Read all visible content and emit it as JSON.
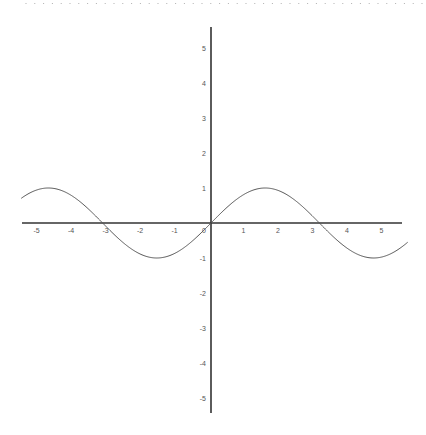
{
  "chart_data": {
    "type": "line",
    "title": "",
    "xlabel": "",
    "ylabel": "",
    "function": "y = sin(x)",
    "xlim": [
      -5.5,
      5.7
    ],
    "ylim": [
      -5.5,
      5.5
    ],
    "grid": false,
    "legend": null,
    "x_ticks": [
      -5,
      -4,
      -3,
      -2,
      -1,
      0,
      1,
      2,
      3,
      4,
      5
    ],
    "y_ticks": [
      -5,
      -4,
      -3,
      -2,
      -1,
      1,
      2,
      3,
      4,
      5
    ],
    "series": [
      {
        "name": "sin(x)",
        "x": [
          -5.5,
          -4.71,
          -3.14,
          -1.57,
          0,
          1.57,
          3.14,
          4.71,
          5.7
        ],
        "values": [
          0.71,
          1,
          0,
          -1,
          0,
          1,
          0,
          -1,
          -0.55
        ]
      }
    ],
    "colors": {
      "axis": "#333333",
      "curve": "#555555",
      "tick_label": "#555555",
      "border_dots": "#aaaaaa"
    }
  }
}
